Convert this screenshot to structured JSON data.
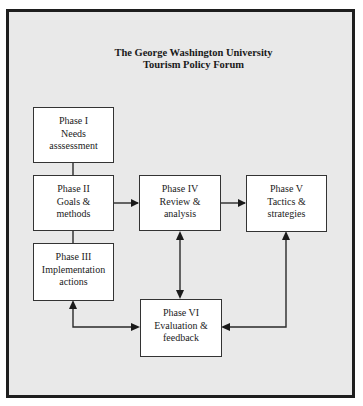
{
  "title": {
    "line1": "The George Washington University",
    "line2": "Tourism Policy Forum"
  },
  "phases": [
    {
      "id": "phase-1",
      "lines": [
        "Phase I",
        "Needs",
        "asssessment"
      ]
    },
    {
      "id": "phase-2",
      "lines": [
        "Phase II",
        "Goals &",
        "methods"
      ]
    },
    {
      "id": "phase-3",
      "lines": [
        "Phase III",
        "Implementation",
        "actions"
      ]
    },
    {
      "id": "phase-4",
      "lines": [
        "Phase IV",
        "Review &",
        "analysis"
      ]
    },
    {
      "id": "phase-5",
      "lines": [
        "Phase V",
        "Tactics &",
        "strategies"
      ]
    },
    {
      "id": "phase-6",
      "lines": [
        "Phase VI",
        "Evaluation &",
        "feedback"
      ]
    }
  ],
  "connections": [
    {
      "from": "phase-1",
      "to": "phase-2",
      "type": "line"
    },
    {
      "from": "phase-2",
      "to": "phase-3",
      "type": "line"
    },
    {
      "from": "phase-2",
      "to": "phase-4",
      "type": "arrow"
    },
    {
      "from": "phase-4",
      "to": "phase-5",
      "type": "arrow"
    },
    {
      "from": "phase-4",
      "to": "phase-6",
      "type": "double-arrow"
    },
    {
      "from": "phase-3",
      "to": "phase-6",
      "type": "double-arrow"
    },
    {
      "from": "phase-5",
      "to": "phase-6",
      "type": "double-arrow"
    }
  ],
  "colors": {
    "background": "#e9e9e9",
    "box": "#ffffff",
    "line": "#222222"
  }
}
